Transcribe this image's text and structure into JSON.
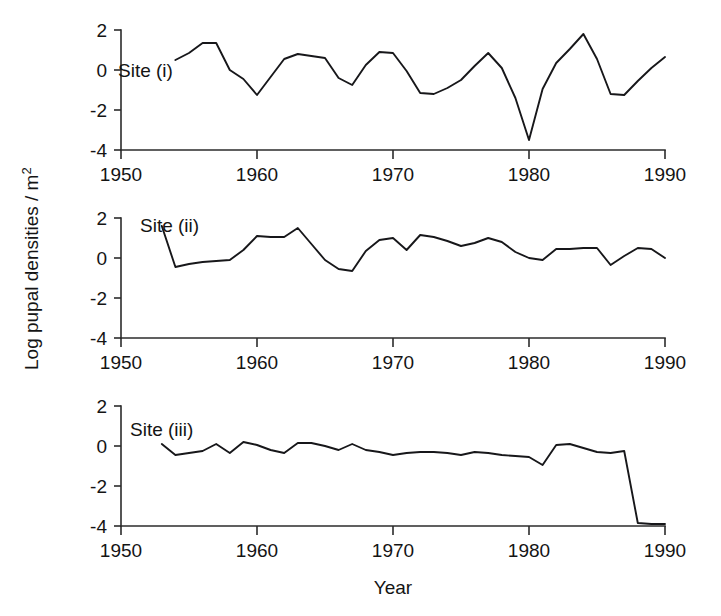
{
  "figure": {
    "title": "",
    "y_axis_label": "Log pupal densities / m",
    "y_axis_label_superscript": "2",
    "x_axis_label": "Year",
    "panel_labels": [
      "Site (i)",
      "Site (ii)",
      "Site (iii)"
    ],
    "x_tick_labels": [
      "1950",
      "1960",
      "1970",
      "1980",
      "1990"
    ],
    "y_tick_labels": [
      "2",
      "0",
      "-2",
      "-4"
    ],
    "line_color": "#17171a",
    "axis_color": "#2b2b2b",
    "background_color": "#ffffff"
  },
  "chart_data": {
    "type": "line",
    "title": "",
    "xlabel": "Year",
    "ylabel": "Log pupal densities / m^2",
    "xlim": [
      1947,
      1991
    ],
    "ylim": [
      -4,
      2
    ],
    "xticks": [
      1950,
      1960,
      1970,
      1980,
      1990
    ],
    "yticks": [
      2,
      0,
      -2,
      -4
    ],
    "grid": false,
    "legend": "none",
    "panels": [
      {
        "name": "Site (i)",
        "label": "Site (i)",
        "x": [
          1954,
          1955,
          1956,
          1957,
          1958,
          1959,
          1960,
          1961,
          1962,
          1963,
          1964,
          1965,
          1966,
          1967,
          1968,
          1969,
          1970,
          1971,
          1972,
          1973,
          1974,
          1975,
          1976,
          1977,
          1978,
          1979,
          1980,
          1981,
          1982,
          1983,
          1984,
          1985,
          1986,
          1987,
          1988,
          1989,
          1990
        ],
        "y": [
          0.5,
          0.85,
          1.35,
          1.35,
          0.0,
          -0.45,
          -1.25,
          -0.35,
          0.55,
          0.8,
          0.7,
          0.6,
          -0.4,
          -0.75,
          0.25,
          0.9,
          0.85,
          -0.05,
          -1.15,
          -1.2,
          -0.9,
          -0.5,
          0.2,
          0.85,
          0.1,
          -1.4,
          -3.5,
          -0.95,
          0.35,
          1.05,
          1.8,
          0.55,
          -1.2,
          -1.25,
          -0.55,
          0.1,
          0.65
        ]
      },
      {
        "name": "Site (ii)",
        "label": "Site (ii)",
        "x": [
          1953,
          1954,
          1955,
          1956,
          1957,
          1958,
          1959,
          1960,
          1961,
          1962,
          1963,
          1964,
          1965,
          1966,
          1967,
          1968,
          1969,
          1970,
          1971,
          1972,
          1973,
          1974,
          1975,
          1976,
          1977,
          1978,
          1979,
          1980,
          1981,
          1982,
          1983,
          1984,
          1985,
          1986,
          1987,
          1988,
          1989,
          1990
        ],
        "y": [
          1.6,
          -0.45,
          -0.3,
          -0.2,
          -0.15,
          -0.1,
          0.4,
          1.1,
          1.05,
          1.05,
          1.5,
          0.7,
          -0.1,
          -0.55,
          -0.65,
          0.35,
          0.9,
          1.0,
          0.4,
          1.15,
          1.05,
          0.85,
          0.6,
          0.75,
          1.0,
          0.8,
          0.3,
          0.0,
          -0.1,
          0.45,
          0.45,
          0.5,
          0.5,
          -0.35,
          0.1,
          0.5,
          0.45,
          0.0
        ]
      },
      {
        "name": "Site (iii)",
        "label": "Site (iii)",
        "x": [
          1953,
          1954,
          1955,
          1956,
          1957,
          1958,
          1959,
          1960,
          1961,
          1962,
          1963,
          1964,
          1965,
          1966,
          1967,
          1968,
          1969,
          1970,
          1971,
          1972,
          1973,
          1974,
          1975,
          1976,
          1977,
          1978,
          1979,
          1980,
          1981,
          1982,
          1983,
          1984,
          1985,
          1986,
          1987,
          1988,
          1989,
          1990
        ],
        "y": [
          0.1,
          -0.45,
          -0.35,
          -0.25,
          0.1,
          -0.35,
          0.2,
          0.05,
          -0.2,
          -0.35,
          0.15,
          0.15,
          0.0,
          -0.2,
          0.1,
          -0.2,
          -0.3,
          -0.45,
          -0.35,
          -0.3,
          -0.3,
          -0.35,
          -0.45,
          -0.3,
          -0.35,
          -0.45,
          -0.5,
          -0.55,
          -0.95,
          0.05,
          0.1,
          -0.1,
          -0.3,
          -0.35,
          -0.25,
          -3.85,
          -3.9,
          -3.9
        ]
      }
    ]
  }
}
